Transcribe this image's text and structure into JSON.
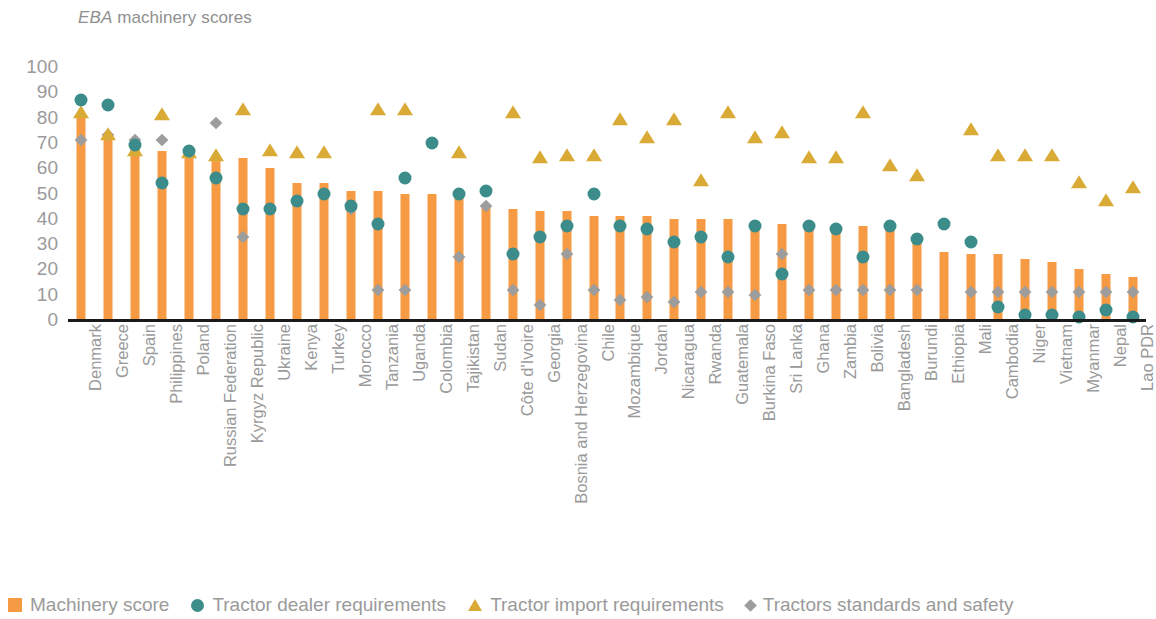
{
  "title": {
    "emphasis": "EBA",
    "rest": " machinery scores"
  },
  "legend": [
    {
      "key": "machinery_score",
      "label": "Machinery score",
      "marker": "square",
      "color": "#f79a44"
    },
    {
      "key": "tractor_dealer",
      "label": "Tractor dealer requirements",
      "marker": "circle",
      "color": "#3c8c8b"
    },
    {
      "key": "tractor_import",
      "label": "Tractor import requirements",
      "marker": "triangle",
      "color": "#d9ab36"
    },
    {
      "key": "tractor_standards",
      "label": "Tractors standards and safety",
      "marker": "diamond",
      "color": "#9d9d9d"
    }
  ],
  "yticks": [
    "100",
    "90",
    "80",
    "70",
    "60",
    "50",
    "40",
    "30",
    "20",
    "10",
    "0"
  ],
  "chart_data": {
    "type": "bar",
    "title": "EBA machinery scores",
    "xlabel": "",
    "ylabel": "",
    "ylim": [
      0,
      100
    ],
    "ytick_step": 10,
    "grid": false,
    "legend_position": "bottom-left",
    "categories": [
      "Denmark",
      "Greece",
      "Spain",
      "Philippines",
      "Poland",
      "Russian Federation",
      "Kyrgyz Republic",
      "Ukraine",
      "Kenya",
      "Turkey",
      "Morocco",
      "Tanzania",
      "Uganda",
      "Colombia",
      "Tajikistan",
      "Sudan",
      "Côte d'Ivoire",
      "Georgia",
      "Bosnia and Herzegovina",
      "Chile",
      "Mozambique",
      "Jordan",
      "Nicaragua",
      "Rwanda",
      "Guatemala",
      "Burkina Faso",
      "Sri Lanka",
      "Ghana",
      "Zambia",
      "Bolivia",
      "Bangladesh",
      "Burundi",
      "Ethiopia",
      "Mali",
      "Cambodia",
      "Niger",
      "Vietnam",
      "Myanmar",
      "Nepal",
      "Lao PDR"
    ],
    "series": [
      {
        "name": "Machinery score",
        "marker": "bar",
        "color": "#f79a44",
        "values": [
          82,
          73,
          69,
          67,
          66,
          64,
          64,
          60,
          54,
          54,
          51,
          51,
          50,
          50,
          48,
          45,
          44,
          43,
          43,
          41,
          41,
          41,
          40,
          40,
          40,
          39,
          38,
          37,
          37,
          37,
          37,
          34,
          27,
          26,
          26,
          24,
          23,
          20,
          18,
          17
        ]
      },
      {
        "name": "Tractor dealer requirements",
        "marker": "circle",
        "color": "#3c8c8b",
        "values": [
          87,
          85,
          69,
          54,
          67,
          56,
          44,
          44,
          47,
          50,
          45,
          38,
          56,
          70,
          50,
          51,
          26,
          33,
          37,
          50,
          37,
          36,
          31,
          33,
          25,
          37,
          18,
          37,
          36,
          25,
          37,
          32,
          38,
          31,
          5,
          2,
          2,
          1,
          4,
          1
        ]
      },
      {
        "name": "Tractor import requirements",
        "marker": "triangle",
        "color": "#d9ab36",
        "values": [
          82,
          73,
          67,
          81,
          66,
          65,
          83,
          67,
          66,
          66,
          null,
          83,
          83,
          null,
          66,
          null,
          82,
          64,
          65,
          65,
          79,
          72,
          79,
          55,
          82,
          72,
          74,
          64,
          64,
          82,
          61,
          57,
          null,
          75,
          65,
          65,
          65,
          54,
          47,
          52
        ]
      },
      {
        "name": "Tractors standards and safety",
        "marker": "diamond",
        "color": "#9d9d9d",
        "values": [
          71,
          73,
          71,
          71,
          66,
          78,
          33,
          null,
          null,
          null,
          44,
          12,
          12,
          null,
          25,
          45,
          12,
          6,
          26,
          12,
          8,
          9,
          7,
          11,
          11,
          10,
          26,
          12,
          12,
          12,
          12,
          12,
          null,
          11,
          11,
          11,
          11,
          11,
          11,
          11
        ]
      }
    ]
  }
}
